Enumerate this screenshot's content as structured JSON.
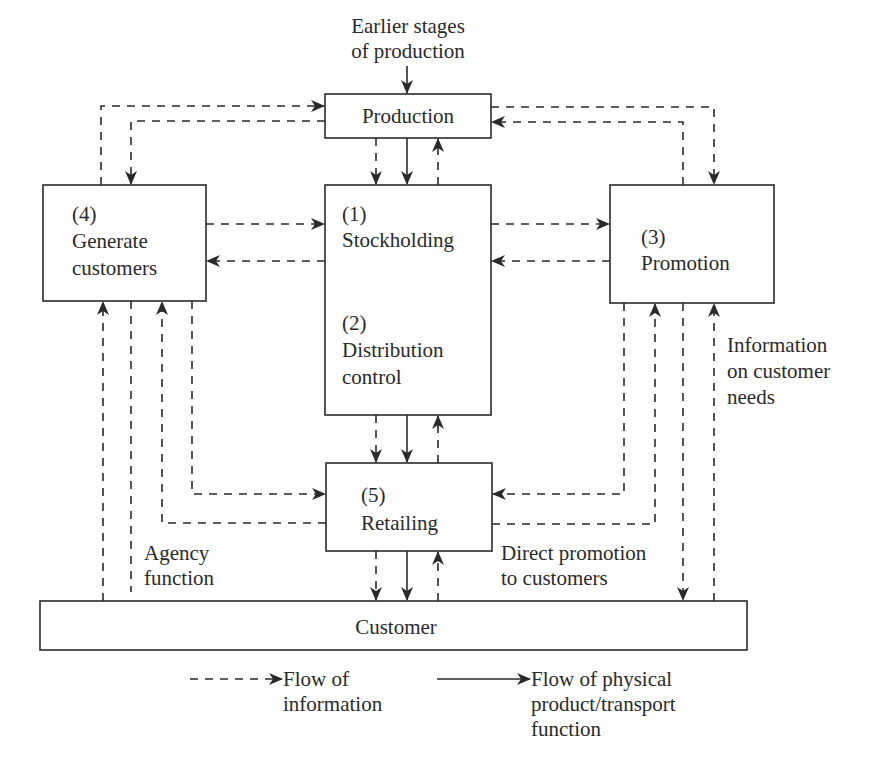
{
  "diagram": {
    "type": "flow-diagram",
    "colors": {
      "line": "#2a2a2a",
      "background": "#ffffff"
    },
    "top_input": {
      "line1": "Earlier stages",
      "line2": "of production"
    },
    "nodes": {
      "production": {
        "label": "Production"
      },
      "stockholding": {
        "number": "(1)",
        "label": "Stockholding"
      },
      "distribution_control": {
        "number": "(2)",
        "line1": "Distribution",
        "line2": "control"
      },
      "promotion": {
        "number": "(3)",
        "label": "Promotion"
      },
      "generate_customers": {
        "number": "(4)",
        "line1": "Generate",
        "line2": "customers"
      },
      "retailing": {
        "number": "(5)",
        "label": "Retailing"
      },
      "customer": {
        "label": "Customer"
      }
    },
    "annotations": {
      "agency": {
        "line1": "Agency",
        "line2": "function"
      },
      "direct_promotion": {
        "line1": "Direct promotion",
        "line2": "to customers"
      },
      "info_needs": {
        "line1": "Information",
        "line2": "on customer",
        "line3": "needs"
      }
    },
    "legend": {
      "information": {
        "line1": "Flow of",
        "line2": "information",
        "style": "dashed"
      },
      "physical": {
        "line1": "Flow of physical",
        "line2": "product/transport",
        "line3": "function",
        "style": "solid"
      }
    },
    "edges": [
      {
        "from": "earlier-stages",
        "to": "production",
        "style": "solid"
      },
      {
        "from": "generate_customers",
        "to": "production",
        "style": "dashed"
      },
      {
        "from": "production",
        "to": "generate_customers",
        "style": "dashed"
      },
      {
        "from": "production",
        "to": "promotion",
        "style": "dashed"
      },
      {
        "from": "promotion",
        "to": "production",
        "style": "dashed"
      },
      {
        "from": "production",
        "to": "stockholding",
        "style": "dashed"
      },
      {
        "from": "production",
        "to": "stockholding",
        "style": "solid"
      },
      {
        "from": "stockholding",
        "to": "production",
        "style": "dashed"
      },
      {
        "from": "generate_customers",
        "to": "stockholding",
        "style": "dashed"
      },
      {
        "from": "stockholding",
        "to": "generate_customers",
        "style": "dashed"
      },
      {
        "from": "stockholding",
        "to": "promotion",
        "style": "dashed"
      },
      {
        "from": "promotion",
        "to": "stockholding",
        "style": "dashed"
      },
      {
        "from": "distribution_control",
        "to": "retailing",
        "style": "dashed"
      },
      {
        "from": "distribution_control",
        "to": "retailing",
        "style": "solid"
      },
      {
        "from": "retailing",
        "to": "distribution_control",
        "style": "dashed"
      },
      {
        "from": "generate_customers",
        "to": "retailing",
        "style": "dashed"
      },
      {
        "from": "retailing",
        "to": "generate_customers",
        "style": "dashed"
      },
      {
        "from": "promotion",
        "to": "retailing",
        "style": "dashed"
      },
      {
        "from": "retailing",
        "to": "promotion",
        "style": "dashed"
      },
      {
        "from": "retailing",
        "to": "customer",
        "style": "dashed"
      },
      {
        "from": "retailing",
        "to": "customer",
        "style": "solid"
      },
      {
        "from": "customer",
        "to": "retailing",
        "style": "dashed"
      },
      {
        "from": "customer",
        "to": "generate_customers",
        "style": "dashed"
      },
      {
        "from": "generate_customers",
        "to": "customer",
        "style": "dashed",
        "label": "Agency function"
      },
      {
        "from": "promotion",
        "to": "customer",
        "style": "dashed",
        "label": "Direct promotion to customers"
      },
      {
        "from": "customer",
        "to": "promotion",
        "style": "dashed",
        "label": "Information on customer needs"
      }
    ]
  }
}
